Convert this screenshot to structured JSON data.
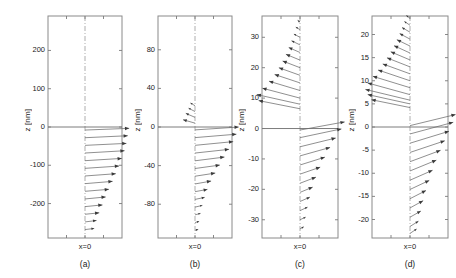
{
  "figure": {
    "background_color": "#ffffff",
    "axis_color": "#8a8a8a",
    "arrow_color": "#6b6b6b",
    "arrowhead_color": "#3a3a3a"
  },
  "chart_data": {
    "type": "scatter",
    "title": "",
    "xlabel": "x=0",
    "ylabel": "z [nm]",
    "grid": false,
    "legend_position": "none",
    "panels": [
      {
        "id": "a",
        "label": "(a)",
        "ylabel": "z [nm]",
        "xlabel": "x=0",
        "yticks": [
          200,
          100,
          0,
          -100,
          -200
        ],
        "ytick_labels": [
          "200",
          "100",
          "0",
          "-100",
          "-200"
        ],
        "ylim": [
          -290,
          290
        ],
        "xlim": [
          -1.0,
          1.0
        ],
        "zero_line": 0,
        "dash_line_x": 0,
        "vectors": [
          {
            "z": -8,
            "u": 0.96,
            "v": 0.06
          },
          {
            "z": -28,
            "u": 0.93,
            "v": 0.07
          },
          {
            "z": -48,
            "u": 0.9,
            "v": 0.07
          },
          {
            "z": -68,
            "u": 0.86,
            "v": 0.08
          },
          {
            "z": -88,
            "u": 0.8,
            "v": 0.08
          },
          {
            "z": -108,
            "u": 0.74,
            "v": 0.08
          },
          {
            "z": -128,
            "u": 0.67,
            "v": 0.08
          },
          {
            "z": -148,
            "u": 0.6,
            "v": 0.08
          },
          {
            "z": -168,
            "u": 0.52,
            "v": 0.07
          },
          {
            "z": -188,
            "u": 0.45,
            "v": 0.07
          },
          {
            "z": -208,
            "u": 0.38,
            "v": 0.06
          },
          {
            "z": -228,
            "u": 0.31,
            "v": 0.05
          },
          {
            "z": -248,
            "u": 0.25,
            "v": 0.05
          },
          {
            "z": -268,
            "u": 0.2,
            "v": 0.04
          }
        ]
      },
      {
        "id": "b",
        "label": "(b)",
        "ylabel": "z [nm]",
        "xlabel": "x=0",
        "yticks": [
          80,
          40,
          0,
          -40,
          -80
        ],
        "ytick_labels": [
          "80",
          "40",
          "0",
          "-40",
          "-80"
        ],
        "ylim": [
          -115,
          115
        ],
        "xlim": [
          -1.0,
          1.0
        ],
        "zero_line": 0,
        "dash_line_x": 0,
        "vectors": [
          {
            "z": 22,
            "u": -0.1,
            "v": 0.1
          },
          {
            "z": 16,
            "u": -0.14,
            "v": 0.12
          },
          {
            "z": 10,
            "u": -0.2,
            "v": 0.14
          },
          {
            "z": 4,
            "u": -0.26,
            "v": 0.12
          },
          {
            "z": -3,
            "u": 0.95,
            "v": 0.1
          },
          {
            "z": -11,
            "u": 0.9,
            "v": 0.12
          },
          {
            "z": -19,
            "u": 0.83,
            "v": 0.13
          },
          {
            "z": -27,
            "u": 0.74,
            "v": 0.13
          },
          {
            "z": -35,
            "u": 0.64,
            "v": 0.13
          },
          {
            "z": -43,
            "u": 0.54,
            "v": 0.12
          },
          {
            "z": -51,
            "u": 0.44,
            "v": 0.11
          },
          {
            "z": -59,
            "u": 0.35,
            "v": 0.1
          },
          {
            "z": -67,
            "u": 0.27,
            "v": 0.08
          },
          {
            "z": -75,
            "u": 0.21,
            "v": 0.07
          },
          {
            "z": -83,
            "u": 0.16,
            "v": 0.06
          },
          {
            "z": -91,
            "u": 0.12,
            "v": 0.05
          },
          {
            "z": -99,
            "u": 0.09,
            "v": 0.04
          },
          {
            "z": -107,
            "u": 0.07,
            "v": 0.03
          }
        ]
      },
      {
        "id": "c",
        "label": "(c)",
        "ylabel": "z [nm]",
        "xlabel": "x=0",
        "yticks": [
          30,
          20,
          10,
          0,
          -10,
          -20,
          -30
        ],
        "ytick_labels": [
          "30",
          "20",
          "10",
          "0",
          "-10",
          "-20",
          "-30"
        ],
        "ylim": [
          -36,
          37
        ],
        "xlim": [
          -1.0,
          1.0
        ],
        "zero_line": 0,
        "dash_line_x": 0,
        "vectors": [
          {
            "z": 35,
            "u": -0.05,
            "v": 0.06
          },
          {
            "z": 32.5,
            "u": -0.09,
            "v": 0.09
          },
          {
            "z": 30,
            "u": -0.13,
            "v": 0.11
          },
          {
            "z": 27.5,
            "u": -0.18,
            "v": 0.14
          },
          {
            "z": 25,
            "u": -0.24,
            "v": 0.17
          },
          {
            "z": 22.5,
            "u": -0.3,
            "v": 0.2
          },
          {
            "z": 20,
            "u": -0.37,
            "v": 0.23
          },
          {
            "z": 17.5,
            "u": -0.45,
            "v": 0.26
          },
          {
            "z": 15,
            "u": -0.54,
            "v": 0.29
          },
          {
            "z": 12.5,
            "u": -0.66,
            "v": 0.32
          },
          {
            "z": 10,
            "u": -0.8,
            "v": 0.34
          },
          {
            "z": 8,
            "u": -0.92,
            "v": 0.33
          },
          {
            "z": 6.5,
            "u": -0.88,
            "v": 0.28
          },
          {
            "z": -0.5,
            "u": 0.95,
            "v": 0.28
          },
          {
            "z": -3,
            "u": 0.88,
            "v": 0.3
          },
          {
            "z": -6,
            "u": 0.76,
            "v": 0.3
          },
          {
            "z": -9,
            "u": 0.64,
            "v": 0.29
          },
          {
            "z": -12,
            "u": 0.53,
            "v": 0.27
          },
          {
            "z": -15,
            "u": 0.43,
            "v": 0.24
          },
          {
            "z": -18,
            "u": 0.34,
            "v": 0.21
          },
          {
            "z": -21,
            "u": 0.27,
            "v": 0.18
          },
          {
            "z": -24,
            "u": 0.21,
            "v": 0.15
          },
          {
            "z": -27,
            "u": 0.16,
            "v": 0.12
          },
          {
            "z": -30,
            "u": 0.12,
            "v": 0.09
          },
          {
            "z": -33,
            "u": 0.08,
            "v": 0.07
          }
        ]
      },
      {
        "id": "d",
        "label": "(d)",
        "ylabel": "z [nm]",
        "xlabel": "x=0",
        "yticks": [
          20,
          15,
          10,
          5,
          0,
          -5,
          -10,
          -15,
          -20
        ],
        "ytick_labels": [
          "20",
          "15",
          "10",
          "5",
          "0",
          "-5",
          "-10",
          "-15",
          "-20"
        ],
        "ylim": [
          -24,
          24
        ],
        "xlim": [
          -1.0,
          1.0
        ],
        "zero_line": 0,
        "dash_line_x": 0,
        "vectors": [
          {
            "z": 23.5,
            "u": -0.08,
            "v": 0.1
          },
          {
            "z": 22,
            "u": -0.12,
            "v": 0.13
          },
          {
            "z": 20.5,
            "u": -0.17,
            "v": 0.16
          },
          {
            "z": 19,
            "u": -0.22,
            "v": 0.19
          },
          {
            "z": 17.5,
            "u": -0.28,
            "v": 0.22
          },
          {
            "z": 16,
            "u": -0.34,
            "v": 0.25
          },
          {
            "z": 14.5,
            "u": -0.41,
            "v": 0.28
          },
          {
            "z": 13,
            "u": -0.49,
            "v": 0.31
          },
          {
            "z": 11.5,
            "u": -0.58,
            "v": 0.34
          },
          {
            "z": 10,
            "u": -0.68,
            "v": 0.37
          },
          {
            "z": 8.5,
            "u": -0.79,
            "v": 0.39
          },
          {
            "z": 7,
            "u": -0.9,
            "v": 0.4
          },
          {
            "z": 5.8,
            "u": -0.95,
            "v": 0.37
          },
          {
            "z": 5.0,
            "u": -0.9,
            "v": 0.32
          },
          {
            "z": 4.2,
            "u": -0.82,
            "v": 0.27
          },
          {
            "z": 0.3,
            "u": 0.97,
            "v": 0.38
          },
          {
            "z": -1.5,
            "u": 0.92,
            "v": 0.4
          },
          {
            "z": -3.5,
            "u": 0.83,
            "v": 0.41
          },
          {
            "z": -5.5,
            "u": 0.74,
            "v": 0.4
          },
          {
            "z": -7.5,
            "u": 0.65,
            "v": 0.39
          },
          {
            "z": -9.5,
            "u": 0.56,
            "v": 0.37
          },
          {
            "z": -11.5,
            "u": 0.48,
            "v": 0.34
          },
          {
            "z": -13.5,
            "u": 0.41,
            "v": 0.31
          },
          {
            "z": -15.5,
            "u": 0.34,
            "v": 0.28
          },
          {
            "z": -17.5,
            "u": 0.28,
            "v": 0.25
          },
          {
            "z": -19.5,
            "u": 0.23,
            "v": 0.21
          },
          {
            "z": -21.5,
            "u": 0.18,
            "v": 0.18
          },
          {
            "z": -23,
            "u": 0.14,
            "v": 0.15
          }
        ]
      }
    ]
  }
}
